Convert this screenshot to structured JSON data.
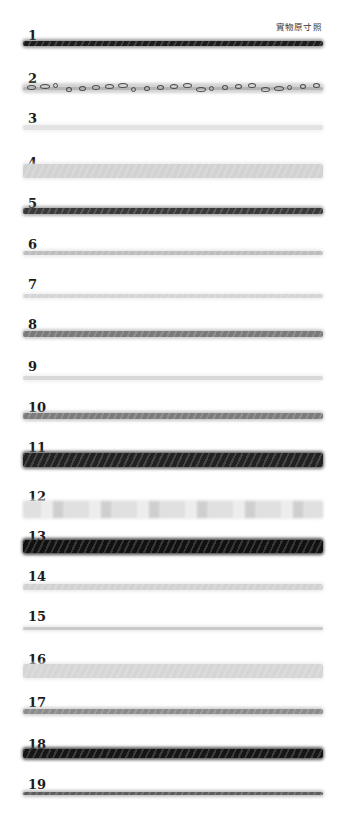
{
  "caption": "實物原寸照",
  "samples": [
    {
      "label": "1",
      "label_y": 29,
      "y": 41,
      "h": 5,
      "color": "#1c1c1c",
      "fuzz": "#5a5a5a",
      "texture": "twist"
    },
    {
      "label": "2",
      "label_y": 72,
      "y": 85,
      "h": 6,
      "color": "#4a4a4a",
      "fuzz": "#b5b5b5",
      "texture": "boucle"
    },
    {
      "label": "3",
      "label_y": 112,
      "y": 125,
      "h": 5,
      "color": "#e3e3e3",
      "fuzz": "#ececec",
      "texture": "plain"
    },
    {
      "label": "4",
      "label_y": 156,
      "y": 164,
      "h": 14,
      "color": "#d2d2d2",
      "fuzz": "#e2e2e2",
      "texture": "twist"
    },
    {
      "label": "5",
      "label_y": 197,
      "y": 208,
      "h": 6,
      "color": "#3a3a3a",
      "fuzz": "#7a7a7a",
      "texture": "twist"
    },
    {
      "label": "6",
      "label_y": 238,
      "y": 251,
      "h": 4,
      "color": "#bdbdbd",
      "fuzz": "#dedede",
      "texture": "twist"
    },
    {
      "label": "7",
      "label_y": 278,
      "y": 294,
      "h": 4,
      "color": "#d5d5d5",
      "fuzz": "#e8e8e8",
      "texture": "twist"
    },
    {
      "label": "8",
      "label_y": 318,
      "y": 331,
      "h": 6,
      "color": "#7a7a7a",
      "fuzz": "#a8a8a8",
      "texture": "twist"
    },
    {
      "label": "9",
      "label_y": 360,
      "y": 376,
      "h": 4,
      "color": "#d8d8d8",
      "fuzz": "#e8e8e8",
      "texture": "plain"
    },
    {
      "label": "10",
      "label_y": 401,
      "y": 413,
      "h": 6,
      "color": "#7c7c7c",
      "fuzz": "#a5a5a5",
      "texture": "twist"
    },
    {
      "label": "11",
      "label_y": 441,
      "y": 453,
      "h": 14,
      "color": "#222222",
      "fuzz": "#5e5e5e",
      "texture": "fuzzy"
    },
    {
      "label": "12",
      "label_y": 490,
      "y": 501,
      "h": 17,
      "color": "#e0e0e0",
      "fuzz": "#ededed",
      "texture": "slub"
    },
    {
      "label": "13",
      "label_y": 530,
      "y": 540,
      "h": 13,
      "color": "#111111",
      "fuzz": "#3e3e3e",
      "texture": "fuzzy"
    },
    {
      "label": "14",
      "label_y": 570,
      "y": 584,
      "h": 6,
      "color": "#d2d2d2",
      "fuzz": "#e3e3e3",
      "texture": "twist"
    },
    {
      "label": "15",
      "label_y": 610,
      "y": 627,
      "h": 3,
      "color": "#c9c9c9",
      "fuzz": "#e2e2e2",
      "texture": "plain"
    },
    {
      "label": "16",
      "label_y": 653,
      "y": 664,
      "h": 14,
      "color": "#d6d6d6",
      "fuzz": "#e5e5e5",
      "texture": "twist"
    },
    {
      "label": "17",
      "label_y": 696,
      "y": 709,
      "h": 5,
      "color": "#8c8c8c",
      "fuzz": "#b5b5b5",
      "texture": "twist"
    },
    {
      "label": "18",
      "label_y": 738,
      "y": 749,
      "h": 9,
      "color": "#161616",
      "fuzz": "#4a4a4a",
      "texture": "fuzzy"
    },
    {
      "label": "19",
      "label_y": 778,
      "y": 792,
      "h": 3,
      "color": "#5e5e5e",
      "fuzz": "#9a9a9a",
      "texture": "twist"
    }
  ]
}
